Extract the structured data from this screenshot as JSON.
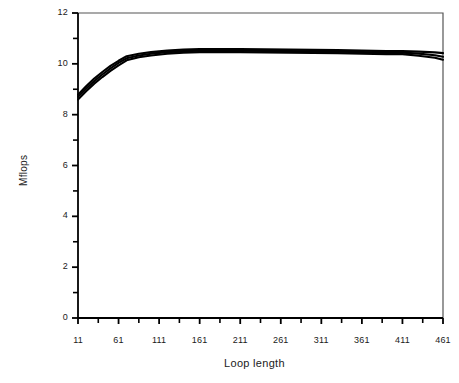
{
  "chart_data": {
    "type": "line",
    "title": "",
    "xlabel": "Loop length",
    "ylabel": "Mflops",
    "xlim": [
      11,
      461
    ],
    "ylim": [
      0,
      12
    ],
    "grid": false,
    "legend": false,
    "legend_position": "none",
    "x_major_ticks": [
      11,
      61,
      111,
      161,
      211,
      261,
      311,
      361,
      411,
      461
    ],
    "x_tick_labels": [
      "11",
      "61",
      "111",
      "161",
      "211",
      "261",
      "311",
      "361",
      "411",
      "461"
    ],
    "x_minor_ticks": [
      36,
      86,
      136,
      186,
      236,
      286,
      336,
      386,
      436
    ],
    "y_major_ticks": [
      0,
      2,
      4,
      6,
      8,
      10,
      12
    ],
    "y_tick_labels": [
      "0",
      "2",
      "4",
      "6",
      "8",
      "10",
      "12"
    ],
    "y_minor_ticks": [
      1,
      3,
      5,
      7,
      9,
      11
    ],
    "line_color": "#000000",
    "axis_color": "#000000",
    "frame_color": "#555555",
    "x": [
      11,
      21,
      31,
      41,
      51,
      61,
      71,
      86,
      101,
      121,
      141,
      161,
      181,
      211,
      241,
      271,
      301,
      331,
      361,
      391,
      411,
      431,
      451,
      461
    ],
    "series": [
      {
        "name": "series-upper",
        "values": [
          8.78,
          9.12,
          9.42,
          9.68,
          9.92,
          10.12,
          10.3,
          10.4,
          10.46,
          10.52,
          10.56,
          10.58,
          10.58,
          10.58,
          10.57,
          10.56,
          10.55,
          10.54,
          10.52,
          10.5,
          10.5,
          10.48,
          10.45,
          10.42
        ]
      },
      {
        "name": "series-mid",
        "values": [
          8.7,
          9.02,
          9.32,
          9.58,
          9.82,
          10.04,
          10.22,
          10.33,
          10.4,
          10.46,
          10.5,
          10.52,
          10.52,
          10.52,
          10.51,
          10.5,
          10.49,
          10.48,
          10.46,
          10.44,
          10.44,
          10.4,
          10.34,
          10.28
        ]
      },
      {
        "name": "series-lower",
        "values": [
          8.6,
          8.92,
          9.22,
          9.48,
          9.72,
          9.94,
          10.14,
          10.26,
          10.33,
          10.4,
          10.44,
          10.46,
          10.46,
          10.46,
          10.45,
          10.44,
          10.43,
          10.42,
          10.4,
          10.38,
          10.38,
          10.32,
          10.24,
          10.16
        ]
      }
    ]
  },
  "axes": {
    "ylabel_text": "Mflops",
    "xlabel_text": "Loop length"
  }
}
